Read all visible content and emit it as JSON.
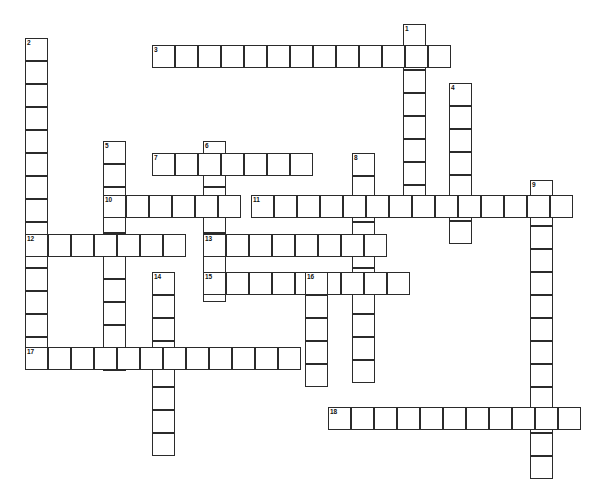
{
  "puzzle": {
    "type": "crossword-grid",
    "width": 612,
    "height": 475,
    "cell_size": 23,
    "background": "#ffffff",
    "line_color": "#2b2b2b",
    "entries": [
      {
        "number": "1",
        "direction": "down",
        "x": 403,
        "y": 24,
        "length": 8
      },
      {
        "number": "2",
        "direction": "down",
        "x": 25,
        "y": 38,
        "length": 14
      },
      {
        "number": "3",
        "direction": "across",
        "x": 152,
        "y": 45,
        "length": 13
      },
      {
        "number": "4",
        "direction": "down",
        "x": 449,
        "y": 83,
        "length": 7
      },
      {
        "number": "5",
        "direction": "down",
        "x": 103,
        "y": 141,
        "length": 10
      },
      {
        "number": "6",
        "direction": "down",
        "x": 203,
        "y": 141,
        "length": 7
      },
      {
        "number": "7",
        "direction": "across",
        "x": 152,
        "y": 153,
        "length": 7
      },
      {
        "number": "8",
        "direction": "down",
        "x": 352,
        "y": 153,
        "length": 10
      },
      {
        "number": "9",
        "direction": "down",
        "x": 530,
        "y": 180,
        "length": 13
      },
      {
        "number": "10",
        "direction": "across",
        "x": 103,
        "y": 195,
        "length": 6
      },
      {
        "number": "11",
        "direction": "across",
        "x": 251,
        "y": 195,
        "length": 14
      },
      {
        "number": "12",
        "direction": "across",
        "x": 25,
        "y": 234,
        "length": 7
      },
      {
        "number": "13",
        "direction": "across",
        "x": 203,
        "y": 234,
        "length": 8
      },
      {
        "number": "14",
        "direction": "down",
        "x": 152,
        "y": 272,
        "length": 8
      },
      {
        "number": "15",
        "direction": "across",
        "x": 203,
        "y": 272,
        "length": 9
      },
      {
        "number": "16",
        "direction": "down",
        "x": 305,
        "y": 272,
        "length": 5
      },
      {
        "number": "17",
        "direction": "across",
        "x": 25,
        "y": 347,
        "length": 12
      },
      {
        "number": "18",
        "direction": "across",
        "x": 328,
        "y": 407,
        "length": 11
      }
    ]
  }
}
